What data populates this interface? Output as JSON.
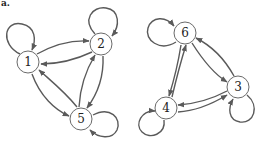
{
  "figure": {
    "label": "a.",
    "stroke_color": "#5a5a5a"
  },
  "graphs": [
    {
      "name": "left-graph",
      "nodes": [
        {
          "id": "1",
          "label": "1",
          "x": 28,
          "y": 62
        },
        {
          "id": "2",
          "label": "2",
          "x": 101,
          "y": 44
        },
        {
          "id": "5",
          "label": "5",
          "x": 81,
          "y": 119
        }
      ],
      "edges": [
        {
          "from": "1",
          "to": "1"
        },
        {
          "from": "2",
          "to": "2"
        },
        {
          "from": "5",
          "to": "5"
        },
        {
          "from": "1",
          "to": "2"
        },
        {
          "from": "2",
          "to": "1"
        },
        {
          "from": "1",
          "to": "5"
        },
        {
          "from": "5",
          "to": "1"
        },
        {
          "from": "2",
          "to": "5"
        },
        {
          "from": "5",
          "to": "2"
        }
      ]
    },
    {
      "name": "right-graph",
      "nodes": [
        {
          "id": "6",
          "label": "6",
          "x": 185,
          "y": 33
        },
        {
          "id": "3",
          "label": "3",
          "x": 238,
          "y": 87
        },
        {
          "id": "4",
          "label": "4",
          "x": 166,
          "y": 108
        }
      ],
      "edges": [
        {
          "from": "6",
          "to": "6"
        },
        {
          "from": "3",
          "to": "3"
        },
        {
          "from": "4",
          "to": "4"
        },
        {
          "from": "6",
          "to": "3"
        },
        {
          "from": "3",
          "to": "6"
        },
        {
          "from": "6",
          "to": "4"
        },
        {
          "from": "4",
          "to": "6"
        },
        {
          "from": "4",
          "to": "3"
        },
        {
          "from": "3",
          "to": "4"
        }
      ]
    }
  ],
  "labels": {
    "n1": "1",
    "n2": "2",
    "n5": "5",
    "n6": "6",
    "n3": "3",
    "n4": "4"
  }
}
